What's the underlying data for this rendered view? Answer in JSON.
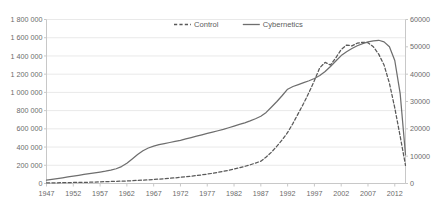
{
  "chart_data": {
    "type": "line",
    "title": "",
    "xlabel": "",
    "grid": true,
    "legend_position": "top-center",
    "x_axis": {
      "tick_labels": [
        "1947",
        "1952",
        "1957",
        "1962",
        "1967",
        "1972",
        "1977",
        "1982",
        "1987",
        "1992",
        "1997",
        "2002",
        "2007",
        "2012"
      ],
      "tick_values": [
        1947,
        1952,
        1957,
        1962,
        1967,
        1972,
        1977,
        1982,
        1987,
        1992,
        1997,
        2002,
        2007,
        2012
      ],
      "xlim": [
        1947,
        2014
      ]
    },
    "y_axis_left": {
      "label": "",
      "ylim": [
        0,
        1800000
      ],
      "tick_labels": [
        "0",
        "200 000",
        "400 000",
        "600 000",
        "800 000",
        "1 000 000",
        "1 200 000",
        "1 400 000",
        "1 600 000",
        "1 800 000"
      ],
      "tick_values": [
        0,
        200000,
        400000,
        600000,
        800000,
        1000000,
        1200000,
        1400000,
        1600000,
        1800000
      ]
    },
    "y_axis_right": {
      "label": "",
      "ylim": [
        0,
        60000
      ],
      "tick_labels": [
        "0",
        "10000",
        "20000",
        "30000",
        "40000",
        "50000",
        "60000"
      ],
      "tick_values": [
        0,
        10000,
        20000,
        30000,
        40000,
        50000,
        60000
      ]
    },
    "series": [
      {
        "name": "Control",
        "axis": "left",
        "style": "dashed",
        "color": "#595959",
        "x": [
          1947,
          1948,
          1949,
          1950,
          1951,
          1952,
          1953,
          1954,
          1955,
          1956,
          1957,
          1958,
          1959,
          1960,
          1961,
          1962,
          1963,
          1964,
          1965,
          1966,
          1967,
          1968,
          1969,
          1970,
          1971,
          1972,
          1973,
          1974,
          1975,
          1976,
          1977,
          1978,
          1979,
          1980,
          1981,
          1982,
          1983,
          1984,
          1985,
          1986,
          1987,
          1988,
          1989,
          1990,
          1991,
          1992,
          1993,
          1994,
          1995,
          1996,
          1997,
          1998,
          1999,
          2000,
          2001,
          2002,
          2003,
          2004,
          2005,
          2006,
          2007,
          2008,
          2009,
          2010,
          2011,
          2012,
          2013,
          2014
        ],
        "values": [
          6000,
          7000,
          8000,
          9000,
          10000,
          11000,
          12000,
          13000,
          14000,
          16000,
          18000,
          20000,
          22000,
          24000,
          26000,
          28000,
          31000,
          34000,
          37000,
          40000,
          44000,
          48000,
          52000,
          57000,
          62000,
          68000,
          74000,
          80000,
          87000,
          95000,
          103000,
          112000,
          122000,
          133000,
          145000,
          158000,
          172000,
          188000,
          205000,
          224000,
          245000,
          290000,
          345000,
          410000,
          480000,
          560000,
          660000,
          770000,
          880000,
          1000000,
          1130000,
          1270000,
          1330000,
          1300000,
          1380000,
          1470000,
          1520000,
          1510000,
          1540000,
          1550000,
          1545000,
          1500000,
          1420000,
          1300000,
          1100000,
          830000,
          520000,
          200000
        ]
      },
      {
        "name": "Cybernetics",
        "axis": "right",
        "style": "solid",
        "color": "#6e6e6e",
        "x": [
          1947,
          1948,
          1949,
          1950,
          1951,
          1952,
          1953,
          1954,
          1955,
          1956,
          1957,
          1958,
          1959,
          1960,
          1961,
          1962,
          1963,
          1964,
          1965,
          1966,
          1967,
          1968,
          1969,
          1970,
          1971,
          1972,
          1973,
          1974,
          1975,
          1976,
          1977,
          1978,
          1979,
          1980,
          1981,
          1982,
          1983,
          1984,
          1985,
          1986,
          1987,
          1988,
          1989,
          1990,
          1991,
          1992,
          1993,
          1994,
          1995,
          1996,
          1997,
          1998,
          1999,
          2000,
          2001,
          2002,
          2003,
          2004,
          2005,
          2006,
          2007,
          2008,
          2009,
          2010,
          2011,
          2012,
          2013,
          2014
        ],
        "values": [
          1200,
          1500,
          1800,
          2100,
          2400,
          2700,
          3000,
          3300,
          3600,
          3900,
          4200,
          4500,
          4900,
          5400,
          6200,
          7400,
          9000,
          10600,
          12000,
          13000,
          13700,
          14200,
          14600,
          15000,
          15400,
          15800,
          16300,
          16800,
          17300,
          17800,
          18300,
          18800,
          19300,
          19800,
          20400,
          21000,
          21600,
          22200,
          22900,
          23700,
          24600,
          26000,
          28000,
          30000,
          32200,
          34500,
          35500,
          36200,
          36900,
          37600,
          38400,
          39500,
          41000,
          42800,
          44800,
          46800,
          48200,
          49400,
          50400,
          51200,
          51800,
          52200,
          52400,
          51800,
          50000,
          45000,
          33000,
          10500
        ]
      }
    ],
    "legend": [
      {
        "label": "Control",
        "style": "dashed"
      },
      {
        "label": "Cybernetics",
        "style": "solid"
      }
    ]
  },
  "colors": {
    "gridline": "#e9e9e9",
    "axis": "#c8c8c8",
    "tick_text": "#6b6b6b",
    "control_line": "#595959",
    "cybernetics_line": "#6e6e6e"
  }
}
